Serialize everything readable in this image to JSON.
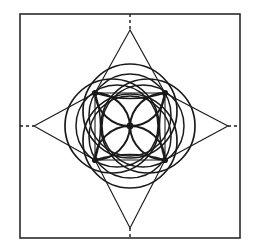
{
  "figure": {
    "title": "Four-pointed star with central circle rosette",
    "background_color": "#ffffff",
    "stroke_color": "#1a1a1a",
    "frame_color": "#2b2b2b",
    "canvas": {
      "width": 257,
      "height": 251
    }
  },
  "frame": {
    "name": "outer-border-rectangle",
    "x": 20,
    "y": 14,
    "width": 220,
    "height": 224,
    "stroke_width": 1.6
  },
  "geometry": {
    "center": {
      "x": 130,
      "y": 126
    },
    "star_points": {
      "top": {
        "x": 130,
        "y": 30
      },
      "right": {
        "x": 228,
        "y": 126
      },
      "bottom": {
        "x": 130,
        "y": 228
      },
      "left": {
        "x": 34,
        "y": 126
      }
    },
    "nodes": [
      {
        "label": "top-left-node",
        "x": 95,
        "y": 93
      },
      {
        "label": "top-right-node",
        "x": 165,
        "y": 93
      },
      {
        "label": "bottom-right-node",
        "x": 165,
        "y": 160
      },
      {
        "label": "bottom-left-node",
        "x": 95,
        "y": 160
      }
    ],
    "node_radius": 3.1,
    "center_node_radius": 3.4,
    "outer_circle_radius": 47,
    "mid_circle_radius": 41,
    "petal_radius": 35,
    "stroke_width_thin": 1.1,
    "stroke_width_thick": 2.0
  },
  "dashes": {
    "name": "axis-dash-extensions",
    "pattern": "3 3",
    "stroke_width": 1.4,
    "segments": [
      {
        "label": "top-dash",
        "x1": 130,
        "y1": 14,
        "x2": 130,
        "y2": 30
      },
      {
        "label": "bottom-dash",
        "x1": 130,
        "y1": 228,
        "x2": 130,
        "y2": 238
      },
      {
        "label": "left-dash",
        "x1": 20,
        "y1": 126,
        "x2": 34,
        "y2": 126
      },
      {
        "label": "right-dash",
        "x1": 228,
        "y1": 126,
        "x2": 240,
        "y2": 126
      }
    ]
  },
  "chart_data": {
    "type": "diagram",
    "title": "Four-pointed star with central circle rosette",
    "elements": [
      "outer-border-rectangle",
      "upper-triangle",
      "lower-triangle",
      "left-triangle",
      "right-triangle",
      "outer-circle-left",
      "outer-circle-right",
      "outer-circle-top",
      "outer-circle-bottom",
      "petal-arc-upper-left",
      "petal-arc-upper-right",
      "petal-arc-lower-right",
      "petal-arc-lower-left",
      "node-markers",
      "axis-dash-extensions"
    ]
  }
}
